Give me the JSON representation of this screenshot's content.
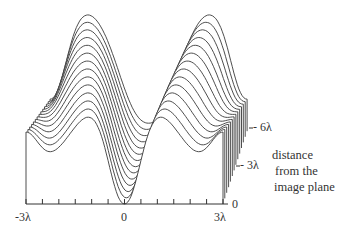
{
  "figure": {
    "type": "3d-waterfall",
    "num_curves": 14,
    "x_axis": {
      "ticks": [
        "-3λ",
        "0",
        "3λ"
      ],
      "range": [
        -3,
        3
      ],
      "unit": "λ",
      "minor_tick_step": 0.5
    },
    "depth_axis": {
      "ticks": [
        "0",
        "-3λ",
        "-6λ"
      ],
      "label_lines": [
        "distance",
        "from the",
        "image plane"
      ]
    },
    "line_color": "#3a3a3a",
    "background": "#ffffff"
  },
  "labels": {
    "x_left": "-3λ",
    "x_center": "0",
    "x_right": "3λ",
    "depth_0": "0",
    "depth_3": "- 3λ",
    "depth_6": "- 6λ",
    "caption_1": "distance",
    "caption_2": "from the",
    "caption_3": "image plane"
  },
  "chart_data": {
    "type": "line",
    "title": "",
    "xlabel": "",
    "ylabel": "",
    "zlabel": "distance from the image plane",
    "x": [
      -3,
      -2.5,
      -2,
      -1.5,
      -1,
      -0.5,
      0,
      0.5,
      1,
      1.5,
      2,
      2.5,
      3
    ],
    "xlim": [
      -3,
      3
    ],
    "z_ticks": [
      "0",
      "-3λ",
      "-6λ"
    ],
    "series": [
      {
        "name": "z=0 (front)",
        "values": [
          0.72,
          0.53,
          0.52,
          0.78,
          0.89,
          0.55,
          0.0,
          0.55,
          0.89,
          0.78,
          0.52,
          0.53,
          0.72
        ]
      },
      {
        "name": "z≈-3λ (middle)",
        "values": [
          0.55,
          0.62,
          0.78,
          0.95,
          0.92,
          0.55,
          0.15,
          0.55,
          0.92,
          0.95,
          0.78,
          0.62,
          0.55
        ]
      },
      {
        "name": "z≈-6.5λ (back)",
        "values": [
          0.35,
          0.6,
          0.98,
          1.16,
          0.95,
          0.5,
          0.12,
          0.5,
          0.95,
          1.16,
          0.98,
          0.6,
          0.35
        ]
      }
    ]
  }
}
